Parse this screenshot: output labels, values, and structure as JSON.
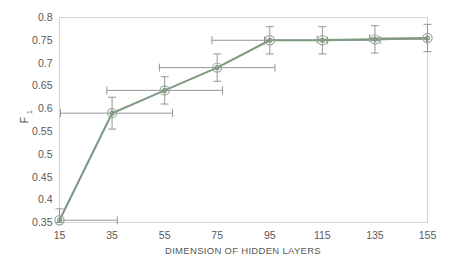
{
  "chart_data": {
    "type": "line",
    "title": "",
    "xlabel": "DIMENSION OF HIDDEN LAYERS",
    "ylabel": "F",
    "ylabel_subscript": "1",
    "x": [
      15,
      35,
      55,
      75,
      95,
      115,
      135,
      155
    ],
    "values": [
      0.355,
      0.59,
      0.64,
      0.69,
      0.75,
      0.75,
      0.752,
      0.755
    ],
    "yerr": [
      0.025,
      0.035,
      0.03,
      0.03,
      0.03,
      0.03,
      0.03,
      0.03
    ],
    "xerr_right": [
      22,
      23,
      22,
      22,
      22,
      22,
      22,
      8
    ],
    "xerr_left": [
      0,
      22,
      22,
      22,
      22,
      22,
      22,
      22
    ],
    "xlim": [
      15,
      155
    ],
    "ylim": [
      0.35,
      0.8
    ],
    "xticks": [
      "15",
      "35",
      "55",
      "75",
      "95",
      "115",
      "135",
      "155"
    ],
    "yticks": [
      "0.35",
      "0.4",
      "0.45",
      "0.5",
      "0.55",
      "0.6",
      "0.65",
      "0.7",
      "0.75",
      "0.8"
    ],
    "grid": false,
    "legend": null,
    "legend_position": "none",
    "series_color": "#7f9a80",
    "marker_color": "#9aa99a",
    "errorbar_color": "#8a8a8a",
    "axis_color": "#d4d4d4",
    "background_color": "#ffffff",
    "marker": "circle-crosshair"
  }
}
